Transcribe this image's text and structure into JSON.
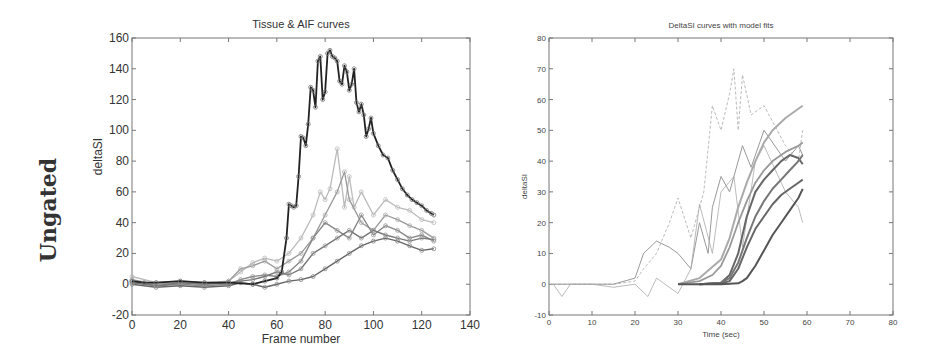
{
  "row_label": "Ungated",
  "chart_data": [
    {
      "type": "line",
      "title": "Tissue & AIF curves",
      "xlabel": "Frame number",
      "ylabel": "deltaSI",
      "xlim": [
        0,
        140
      ],
      "ylim": [
        -20,
        160
      ],
      "xticks": [
        "0",
        "20",
        "40",
        "60",
        "80",
        "100",
        "120",
        "140"
      ],
      "yticks": [
        "-20",
        "0",
        "20",
        "40",
        "60",
        "80",
        "100",
        "120",
        "140",
        "160"
      ],
      "grid": false,
      "legend": null,
      "series": [
        {
          "name": "AIF",
          "style": "dark solid with circle markers",
          "x": [
            0,
            5,
            10,
            20,
            30,
            40,
            50,
            55,
            60,
            62,
            64,
            65,
            66,
            67,
            68,
            69,
            70,
            71,
            72,
            73,
            74,
            75,
            76,
            77,
            78,
            79,
            80,
            81,
            82,
            83,
            84,
            85,
            86,
            87,
            88,
            89,
            90,
            91,
            92,
            93,
            94,
            95,
            96,
            97,
            98,
            99,
            100,
            102,
            104,
            106,
            108,
            110,
            112,
            114,
            116,
            118,
            120,
            122,
            124,
            125
          ],
          "y": [
            2,
            1,
            1,
            2,
            1,
            1,
            0,
            2,
            4,
            8,
            30,
            52,
            51,
            50,
            51,
            70,
            96,
            95,
            90,
            104,
            128,
            126,
            115,
            145,
            148,
            120,
            125,
            150,
            152,
            148,
            147,
            145,
            132,
            130,
            142,
            138,
            126,
            130,
            140,
            118,
            112,
            117,
            110,
            96,
            101,
            108,
            98,
            90,
            84,
            82,
            74,
            68,
            62,
            58,
            55,
            53,
            51,
            48,
            46,
            45
          ]
        },
        {
          "name": "Tissue 1",
          "style": "gray with circle markers",
          "x": [
            0,
            10,
            20,
            30,
            40,
            45,
            50,
            55,
            60,
            65,
            70,
            75,
            78,
            80,
            82,
            85,
            88,
            90,
            92,
            95,
            100,
            105,
            110,
            115,
            120,
            125
          ],
          "y": [
            5,
            1,
            2,
            1,
            2,
            8,
            14,
            17,
            15,
            20,
            30,
            45,
            60,
            55,
            62,
            88,
            50,
            70,
            50,
            60,
            45,
            55,
            50,
            48,
            42,
            40
          ]
        },
        {
          "name": "Tissue 2",
          "style": "gray with circle markers",
          "x": [
            0,
            10,
            20,
            30,
            40,
            45,
            50,
            55,
            60,
            65,
            70,
            75,
            80,
            85,
            88,
            90,
            95,
            100,
            105,
            110,
            115,
            120,
            125
          ],
          "y": [
            3,
            0,
            1,
            0,
            2,
            10,
            12,
            15,
            10,
            15,
            20,
            30,
            45,
            60,
            73,
            55,
            40,
            35,
            45,
            42,
            38,
            35,
            30
          ]
        },
        {
          "name": "Tissue 3",
          "style": "gray with circle markers",
          "x": [
            0,
            10,
            20,
            30,
            40,
            45,
            50,
            55,
            60,
            65,
            70,
            75,
            80,
            85,
            90,
            95,
            100,
            105,
            110,
            115,
            120,
            125
          ],
          "y": [
            2,
            -1,
            0,
            -1,
            0,
            3,
            5,
            6,
            5,
            8,
            15,
            30,
            40,
            35,
            30,
            45,
            32,
            38,
            35,
            30,
            32,
            28
          ]
        },
        {
          "name": "Tissue 4",
          "style": "gray with circle markers",
          "x": [
            0,
            10,
            20,
            30,
            40,
            45,
            50,
            55,
            60,
            65,
            70,
            75,
            80,
            85,
            90,
            95,
            100,
            105,
            110,
            115,
            120,
            125
          ],
          "y": [
            0,
            -2,
            -1,
            -2,
            -1,
            1,
            0,
            -2,
            0,
            2,
            3,
            5,
            10,
            15,
            20,
            25,
            28,
            30,
            28,
            25,
            22,
            23
          ]
        },
        {
          "name": "Tissue 5",
          "style": "gray with circle markers",
          "x": [
            0,
            10,
            20,
            30,
            40,
            45,
            50,
            55,
            60,
            65,
            70,
            75,
            80,
            85,
            90,
            95,
            100,
            105,
            110,
            115,
            120,
            125
          ],
          "y": [
            1,
            -1,
            1,
            0,
            1,
            2,
            3,
            5,
            8,
            6,
            10,
            20,
            25,
            30,
            35,
            30,
            35,
            32,
            30,
            28,
            30,
            29
          ]
        }
      ]
    },
    {
      "type": "line",
      "title": "DeltaSI curves with model fits",
      "xlabel": "Time (sec)",
      "ylabel": "deltaSI",
      "xlim": [
        0,
        80
      ],
      "ylim": [
        -10,
        80
      ],
      "xticks": [
        "0",
        "10",
        "20",
        "30",
        "40",
        "50",
        "60",
        "70",
        "80"
      ],
      "yticks": [
        "-10",
        "0",
        "10",
        "20",
        "30",
        "40",
        "50",
        "60",
        "70",
        "80"
      ],
      "grid": false,
      "legend": null,
      "series": [
        {
          "name": "Data 1",
          "style": "light dashed",
          "x": [
            1,
            5,
            10,
            15,
            20,
            22,
            25,
            28,
            30,
            33,
            36,
            38,
            40,
            42,
            43,
            44,
            45,
            47,
            50,
            55,
            58,
            59
          ],
          "y": [
            0,
            0,
            0,
            0,
            1,
            5,
            10,
            20,
            28,
            15,
            30,
            58,
            50,
            62,
            70,
            50,
            68,
            55,
            58,
            45,
            40,
            50
          ]
        },
        {
          "name": "Data 2",
          "style": "gray solid",
          "x": [
            1,
            5,
            10,
            15,
            20,
            22,
            25,
            28,
            30,
            33,
            35,
            37,
            38,
            40,
            42,
            44,
            45,
            47,
            50,
            55,
            58,
            59
          ],
          "y": [
            0,
            0,
            0,
            0,
            2,
            10,
            14,
            12,
            10,
            5,
            20,
            10,
            25,
            35,
            30,
            40,
            45,
            38,
            50,
            40,
            45,
            42
          ]
        },
        {
          "name": "Data 3",
          "style": "gray thin",
          "x": [
            1,
            3,
            5,
            10,
            15,
            20,
            23,
            25,
            30,
            33,
            35,
            38,
            40,
            43,
            45,
            48,
            50,
            55,
            58,
            59
          ],
          "y": [
            0,
            -4,
            0,
            0,
            -1,
            0,
            -4,
            2,
            -3,
            5,
            26,
            10,
            30,
            35,
            12,
            40,
            45,
            30,
            25,
            20
          ]
        },
        {
          "name": "Fit 1",
          "style": "medium gray thick",
          "x": [
            30,
            35,
            40,
            42,
            44,
            46,
            48,
            50,
            52,
            55,
            58,
            59
          ],
          "y": [
            0,
            2,
            8,
            15,
            25,
            33,
            40,
            46,
            50,
            54,
            57,
            58
          ]
        },
        {
          "name": "Fit 2",
          "style": "gray thick",
          "x": [
            30,
            35,
            38,
            40,
            42,
            44,
            46,
            48,
            50,
            52,
            55,
            58,
            59
          ],
          "y": [
            0,
            1,
            3,
            6,
            12,
            20,
            27,
            33,
            37,
            40,
            43,
            45,
            46
          ]
        },
        {
          "name": "Fit 3",
          "style": "dark thick",
          "x": [
            35,
            40,
            42,
            44,
            46,
            48,
            50,
            52,
            54,
            56,
            58,
            59
          ],
          "y": [
            0,
            0.5,
            3,
            10,
            22,
            30,
            34,
            37,
            40,
            42,
            41,
            39
          ]
        },
        {
          "name": "Fit 4",
          "style": "dark thick",
          "x": [
            35,
            40,
            42,
            44,
            46,
            48,
            50,
            52,
            54,
            56,
            58,
            59
          ],
          "y": [
            0,
            0.5,
            2,
            7,
            15,
            22,
            27,
            31,
            34,
            37,
            40,
            42
          ]
        },
        {
          "name": "Fit 5",
          "style": "dark thick",
          "x": [
            35,
            40,
            42,
            44,
            46,
            48,
            50,
            52,
            54,
            56,
            58,
            59
          ],
          "y": [
            0,
            0.3,
            1,
            5,
            12,
            18,
            22,
            26,
            29,
            31,
            33,
            34
          ]
        },
        {
          "name": "Fit 6",
          "style": "darkest thick",
          "x": [
            30,
            40,
            44,
            45,
            46,
            48,
            50,
            52,
            54,
            56,
            58,
            59
          ],
          "y": [
            0,
            0,
            0.3,
            1,
            2,
            6,
            11,
            16,
            20,
            24,
            28,
            31
          ]
        }
      ]
    }
  ]
}
